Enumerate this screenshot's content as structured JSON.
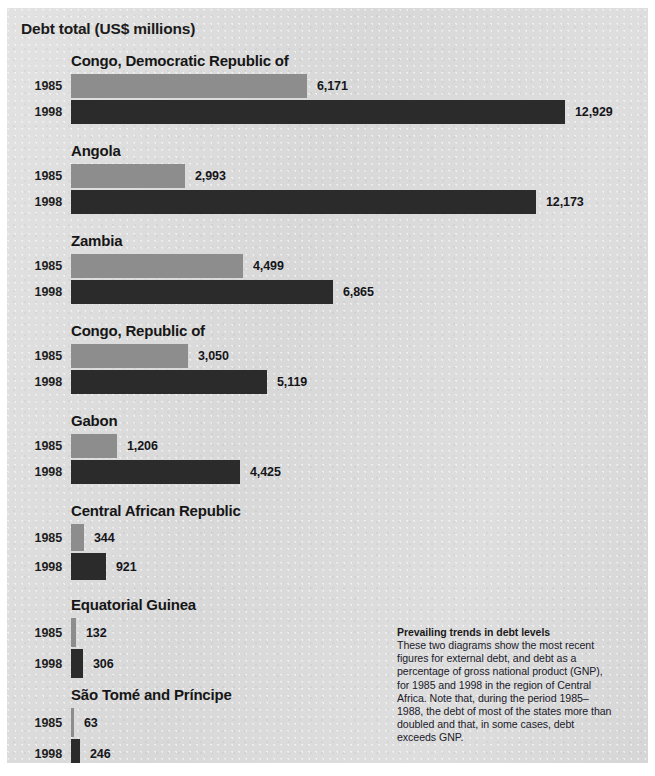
{
  "figure": {
    "title": "Debt total (US$ millions)",
    "background_color": "#dcdcdc",
    "border_color": "#ffffff"
  },
  "legend": {
    "series_1985_label": "1985",
    "series_1985_color": "#8d8d8d",
    "series_1998_label": "1998",
    "series_1998_color": "#2b2b2b"
  },
  "caption": {
    "title": "Prevailing trends in debt levels",
    "body": "These two diagrams show the most recent figures for external debt, and debt as a percentage of gross national product (GNP), for 1985 and 1998 in the region of Central Africa. Note that, during the period 1985–1988, the debt of most of the states more than doubled and that, in some cases, debt exceeds GNP."
  },
  "chart_data": {
    "type": "bar",
    "orientation": "horizontal",
    "title": "Debt total (US$ millions)",
    "subtitle": "",
    "xlabel": "",
    "ylabel": "",
    "unit": "US$ millions",
    "grid": false,
    "legend_position": "row-labels",
    "xlim": [
      0,
      12929
    ],
    "categories": [
      "Congo, Democratic Republic of",
      "Angola",
      "Zambia",
      "Congo, Republic of",
      "Gabon",
      "Central African Republic",
      "Equatorial Guinea",
      "São Tomé and Príncipe"
    ],
    "series": [
      {
        "name": "1985",
        "color": "#8d8d8d",
        "values": [
          6171,
          2993,
          4499,
          3050,
          1206,
          344,
          132,
          63
        ],
        "labels": [
          "6,171",
          "2,993",
          "4,499",
          "3,050",
          "1,206",
          "344",
          "132",
          "63"
        ]
      },
      {
        "name": "1998",
        "color": "#2b2b2b",
        "values": [
          12929,
          12173,
          6865,
          5119,
          4425,
          921,
          306,
          246
        ],
        "labels": [
          "12,929",
          "12,173",
          "6,865",
          "5,119",
          "4,425",
          "921",
          "306",
          "246"
        ]
      }
    ],
    "annotations": [
      "Prevailing trends in debt levels"
    ]
  }
}
